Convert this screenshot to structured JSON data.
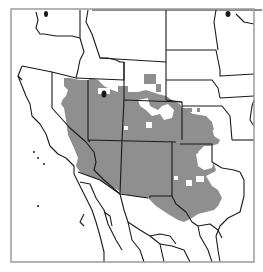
{
  "map": {
    "type": "choropleth-region-map",
    "region": "Western United States and northern Mexico",
    "colors": {
      "background": "#ffffff",
      "shaded_region": "#8f8f8f",
      "state_borders": "#1a1a1a",
      "frame": "#9a9a9a"
    },
    "legend": null,
    "title": null
  }
}
